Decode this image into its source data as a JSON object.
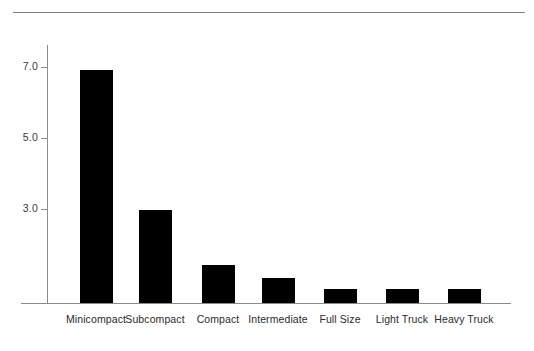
{
  "page": {
    "clipped_header_text": "",
    "background_color": "#ffffff",
    "bar_color": "#000000",
    "axis_color": "#8a8a8a"
  },
  "chart_data": {
    "type": "bar",
    "title": "",
    "subtitle": "",
    "xlabel": "",
    "ylabel": "",
    "categories": [
      "Minicompact",
      "Subcompact",
      "Compact",
      "Intermediate",
      "Full Size",
      "Light Truck",
      "Heavy Truck"
    ],
    "values": [
      6.9,
      2.85,
      1.4,
      1.05,
      0.75,
      0.75,
      0.75
    ],
    "ylim": [
      0.35,
      7.5
    ],
    "yticks": [
      3.0,
      5.0,
      7.0
    ],
    "ytick_labels": [
      "3.0",
      "5.0",
      "7.0"
    ],
    "grid": false,
    "legend": false,
    "legend_position": "none",
    "series": [
      {
        "name": "",
        "values": [
          6.9,
          2.85,
          1.4,
          1.05,
          0.75,
          0.75,
          0.75
        ]
      }
    ]
  },
  "geometry": {
    "top_rule_y": 12,
    "baseline_y": 303,
    "y_axis_x": 47,
    "bar_width": 33,
    "bar_lefts": [
      80,
      139,
      202,
      262,
      324,
      386,
      448
    ],
    "bar_tops": [
      70,
      210,
      265,
      278,
      289,
      289,
      289
    ],
    "ytick_ys": [
      209,
      138,
      67
    ],
    "label_centers": [
      96,
      155,
      218,
      278,
      340,
      402,
      464
    ]
  }
}
